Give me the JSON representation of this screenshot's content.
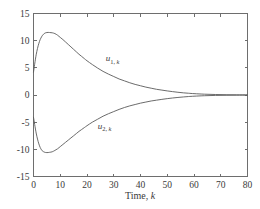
{
  "chart_data": {
    "type": "line",
    "title": "",
    "xlabel": "Time, k",
    "ylabel": "",
    "xlim": [
      0,
      80
    ],
    "ylim": [
      -15,
      15
    ],
    "xticks": [
      0,
      10,
      20,
      30,
      40,
      50,
      60,
      70,
      80
    ],
    "yticks": [
      -15,
      -10,
      -5,
      0,
      5,
      10,
      15
    ],
    "xtick_labels": [
      "0",
      "10",
      "20",
      "30",
      "40",
      "50",
      "60",
      "70",
      "80"
    ],
    "ytick_labels": [
      "-15",
      "-10",
      "-5",
      "0",
      "5",
      "10",
      "15"
    ],
    "grid": false,
    "legend_position": "inline-annotation",
    "line_color": "#5a5a5a",
    "axis_color": "#6e6e6e",
    "background_color": "#ffffff",
    "annotations": [
      {
        "name": "u1-label",
        "text_main": "u",
        "text_sub": "1, ",
        "text_sub_italic": "k",
        "x": 27,
        "y": 6.2
      },
      {
        "name": "u2-label",
        "text_main": "u",
        "text_sub": "2, ",
        "text_sub_italic": "k",
        "x": 24,
        "y": -6.3
      }
    ],
    "series": [
      {
        "name": "u1k",
        "label": "u_{1,k}",
        "x": [
          0,
          1,
          2,
          3,
          4,
          5,
          6,
          7,
          8,
          9,
          10,
          11,
          12,
          13,
          14,
          15,
          16,
          17,
          18,
          19,
          20,
          22,
          24,
          26,
          28,
          30,
          32,
          34,
          36,
          38,
          40,
          42,
          44,
          46,
          48,
          50,
          52,
          54,
          56,
          58,
          60,
          64,
          68,
          72,
          76,
          80
        ],
        "values": [
          4.2,
          7.4,
          9.5,
          10.7,
          11.3,
          11.5,
          11.5,
          11.45,
          11.3,
          11.0,
          10.6,
          10.2,
          9.75,
          9.3,
          8.85,
          8.4,
          7.95,
          7.5,
          7.1,
          6.7,
          6.3,
          5.6,
          4.95,
          4.35,
          3.85,
          3.4,
          2.95,
          2.6,
          2.25,
          1.95,
          1.7,
          1.45,
          1.25,
          1.05,
          0.9,
          0.75,
          0.62,
          0.5,
          0.4,
          0.32,
          0.25,
          0.15,
          0.09,
          0.05,
          0.03,
          0.02
        ]
      },
      {
        "name": "u2k",
        "label": "u_{2,k}",
        "x": [
          0,
          1,
          2,
          3,
          4,
          5,
          6,
          7,
          8,
          9,
          10,
          11,
          12,
          13,
          14,
          15,
          16,
          17,
          18,
          19,
          20,
          22,
          24,
          26,
          28,
          30,
          32,
          34,
          36,
          38,
          40,
          42,
          44,
          46,
          48,
          50,
          52,
          54,
          56,
          58,
          60,
          64,
          68,
          72,
          76,
          80
        ],
        "values": [
          -4.1,
          -7.0,
          -9.0,
          -10.1,
          -10.5,
          -10.6,
          -10.55,
          -10.45,
          -10.2,
          -9.9,
          -9.5,
          -9.1,
          -8.7,
          -8.3,
          -7.9,
          -7.5,
          -7.1,
          -6.7,
          -6.35,
          -6.0,
          -5.65,
          -5.0,
          -4.45,
          -3.9,
          -3.45,
          -3.05,
          -2.65,
          -2.3,
          -2.0,
          -1.75,
          -1.5,
          -1.3,
          -1.1,
          -0.95,
          -0.8,
          -0.67,
          -0.55,
          -0.45,
          -0.36,
          -0.28,
          -0.22,
          -0.13,
          -0.08,
          -0.05,
          -0.03,
          -0.02
        ]
      }
    ]
  },
  "figure": {
    "name": "time-response-plot"
  }
}
